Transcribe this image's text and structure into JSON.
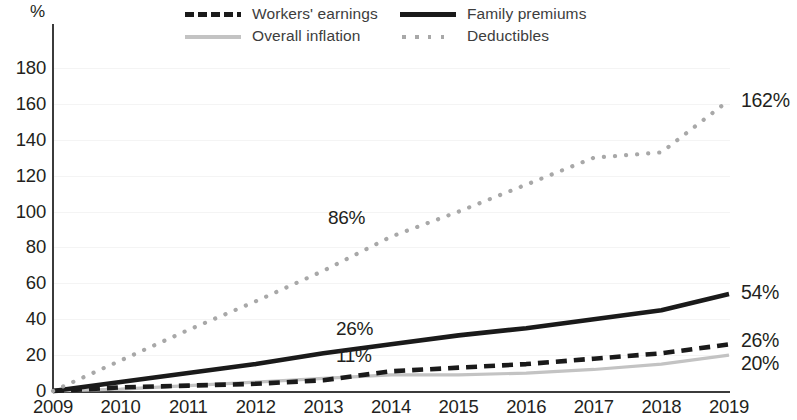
{
  "chart_data": {
    "type": "line",
    "title": "",
    "subtitle": "",
    "xlabel": "",
    "ylabel": "%",
    "y_unit_label": "%",
    "xlim": [
      2009,
      2019
    ],
    "ylim": [
      0,
      180
    ],
    "yticks": [
      0,
      20,
      40,
      60,
      80,
      100,
      120,
      140,
      160,
      180
    ],
    "categories": [
      2009,
      2010,
      2011,
      2012,
      2013,
      2014,
      2015,
      2016,
      2017,
      2018,
      2019
    ],
    "xtick_labels": [
      "2009",
      "2010",
      "2011",
      "2012",
      "2013",
      "2014",
      "2015",
      "2016",
      "2017",
      "2018",
      "2019"
    ],
    "grid": true,
    "legend_position": "top",
    "series": [
      {
        "name": "Workers' earnings",
        "style": "dashed",
        "color": "#1a1a1a",
        "values": [
          0,
          2,
          3,
          4,
          6,
          11,
          13,
          15,
          18,
          21,
          26
        ],
        "end_value": 26,
        "end_label": "26%",
        "inline_label": "11%",
        "inline_label_year": 2014
      },
      {
        "name": "Overall inflation",
        "style": "solid-thin",
        "color": "#c3c3c3",
        "values": [
          0,
          1,
          3,
          5,
          7,
          9,
          9,
          10,
          12,
          15,
          20
        ],
        "end_value": 20,
        "end_label": "20%",
        "inline_label": "",
        "inline_label_year": null
      },
      {
        "name": "Family premiums",
        "style": "solid",
        "color": "#1a1a1a",
        "values": [
          0,
          5,
          10,
          15,
          21,
          26,
          31,
          35,
          40,
          45,
          54
        ],
        "end_value": 54,
        "end_label": "54%",
        "inline_label": "26%",
        "inline_label_year": 2014
      },
      {
        "name": "Deductibles",
        "style": "dotted",
        "color": "#a8a8a8",
        "values": [
          0,
          17,
          34,
          50,
          67,
          86,
          100,
          115,
          130,
          133,
          162
        ],
        "end_value": 162,
        "end_label": "162%",
        "inline_label": "86%",
        "inline_label_year": 2014
      }
    ],
    "annotations": [
      {
        "text": "86%",
        "series": "Deductibles",
        "year": 2014
      },
      {
        "text": "26%",
        "series": "Family premiums",
        "year": 2014
      },
      {
        "text": "11%",
        "series": "Workers' earnings",
        "year": 2014
      },
      {
        "text": "162%",
        "series": "Deductibles",
        "year": 2019
      },
      {
        "text": "54%",
        "series": "Family premiums",
        "year": 2019
      },
      {
        "text": "26%",
        "series": "Workers' earnings",
        "year": 2019
      },
      {
        "text": "20%",
        "series": "Overall inflation",
        "year": 2019
      }
    ]
  },
  "legend": {
    "items": [
      {
        "label": "Workers' earnings",
        "swatch": "dashed-black-line-icon"
      },
      {
        "label": "Overall inflation",
        "swatch": "solid-gray-line-icon"
      },
      {
        "label": "Family premiums",
        "swatch": "solid-black-line-icon"
      },
      {
        "label": "Deductibles",
        "swatch": "dotted-gray-line-icon"
      }
    ]
  },
  "colors": {
    "dark": "#1a1a1a",
    "light_gray": "#c3c3c3",
    "dot_gray": "#a8a8a8",
    "axis": "#3b3b3b",
    "grid": "#f4f4f4",
    "text": "#231f20"
  }
}
